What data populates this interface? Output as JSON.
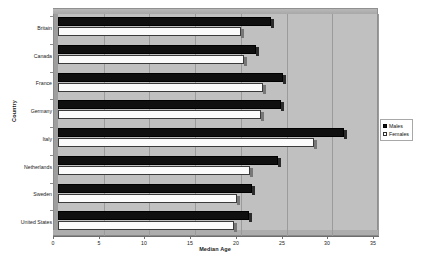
{
  "chart_data": {
    "type": "bar",
    "orientation": "horizontal",
    "title": "",
    "xlabel": "Median Age",
    "ylabel": "Country",
    "xlim": [
      0,
      35
    ],
    "xticks": [
      0,
      5,
      10,
      15,
      20,
      25,
      30,
      35
    ],
    "xtick_labels": [
      "0",
      "5",
      "10",
      "15",
      "20",
      "25",
      "30",
      "35"
    ],
    "grid": true,
    "grid_axis": "x",
    "legend_position": "right",
    "categories": [
      "Britain",
      "Canada",
      "France",
      "Germany",
      "Italy",
      "Netherlands",
      "Sweden",
      "United States"
    ],
    "series": [
      {
        "name": "Males",
        "color": "#0f0f0f",
        "values": [
          23.3,
          21.7,
          24.6,
          24.4,
          31.3,
          24.1,
          21.2,
          20.9
        ]
      },
      {
        "name": "Females",
        "color": "#ffffff",
        "values": [
          20.0,
          20.3,
          22.4,
          22.2,
          28.0,
          21.0,
          19.6,
          19.2
        ]
      }
    ]
  },
  "legend": {
    "entries": [
      {
        "label": "Males",
        "swatch": "filled-square-icon"
      },
      {
        "label": "Females",
        "swatch": "empty-square-icon"
      }
    ]
  }
}
